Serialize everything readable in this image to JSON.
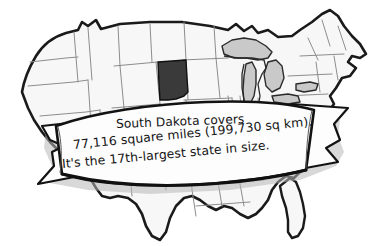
{
  "image": {
    "kind": "illustration",
    "subject": "united-states-map-with-south-dakota-highlighted",
    "background_color": "#ffffff",
    "width": 380,
    "height": 246
  },
  "map": {
    "name": "United States contiguous map outline",
    "outline_color": "#1a1a1a",
    "state_border_color": "#8d8d8d",
    "state_fill_color": "#f7f7f7",
    "highlight": {
      "state": "South Dakota",
      "fill_color": "#3a3a3a"
    },
    "water": {
      "name": "Great Lakes",
      "fill_color": "#c9c9c9"
    }
  },
  "banner": {
    "name": "scroll-ribbon",
    "fill_color": "#fdfdfd",
    "edge_color": "#121212",
    "shadow_color": "#b4b4b4",
    "lines": [
      "South Dakota covers",
      "77,116 square miles (199,730 sq km).",
      "It's the 17th-largest state in size."
    ],
    "line1": "South Dakota covers",
    "line2": "77,116 square miles (199,730 sq km).",
    "line3": "It's the 17th-largest state in size."
  },
  "facts": {
    "state": "South Dakota",
    "area_sq_miles": "77,116",
    "area_sq_km": "199,730",
    "size_rank": "17th-largest"
  }
}
